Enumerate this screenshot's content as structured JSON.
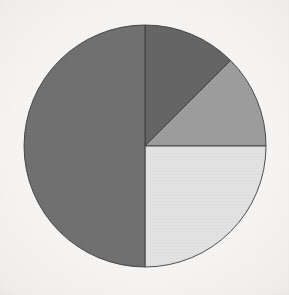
{
  "canvas": {
    "width": 289,
    "height": 295,
    "background_color": "#f7f6f4"
  },
  "geometry": {
    "center_x": 145,
    "center_y": 146,
    "radius": 121,
    "start_angle_deg": 0,
    "direction": "clockwise",
    "outline_color": "#3c3b3b",
    "outline_width": 0.9
  },
  "chart_data": {
    "type": "pie",
    "title": "",
    "subtitle": "",
    "xlabel": "",
    "ylabel": "",
    "grid": false,
    "legend": "none",
    "labels_shown": false,
    "categories": [
      "Segment 1",
      "Segment 2",
      "Segment 3",
      "Segment 4"
    ],
    "values": [
      12.5,
      12.5,
      25,
      50
    ],
    "units": "percent",
    "total": 100,
    "colors": [
      "#656464",
      "#9c9c9c",
      "#e2e2e2",
      "#706f6f"
    ],
    "slices": [
      {
        "name": "Segment 1",
        "value": 12.5,
        "color": "#656464",
        "start_angle_deg": 0,
        "end_angle_deg": 45
      },
      {
        "name": "Segment 2",
        "value": 12.5,
        "color": "#9c9c9c",
        "start_angle_deg": 45,
        "end_angle_deg": 90
      },
      {
        "name": "Segment 3",
        "value": 25,
        "color": "#e2e2e2",
        "start_angle_deg": 90,
        "end_angle_deg": 180
      },
      {
        "name": "Segment 4",
        "value": 50,
        "color": "#706f6f",
        "start_angle_deg": 180,
        "end_angle_deg": 360
      }
    ]
  }
}
